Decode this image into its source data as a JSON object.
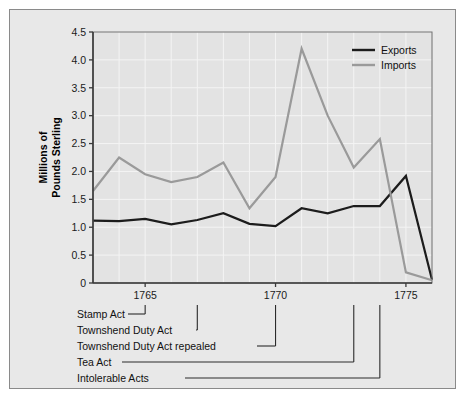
{
  "figure": {
    "background_color": "#e8e8e8",
    "border_color": "#8a8a8a",
    "plot_background": "#e3e3e3",
    "grid_color": "#f4f4f4",
    "axis_color": "#3a3a3a"
  },
  "chart_data": {
    "type": "line",
    "title": "",
    "xlabel": "",
    "ylabel": "Millions of\nPounds Sterling",
    "ylabel_line1": "Millions of",
    "ylabel_line2": "Pounds Sterling",
    "xlim": [
      1763,
      1776
    ],
    "ylim": [
      0,
      4.5
    ],
    "grid": true,
    "legend_position": "top-right",
    "y_ticks": [
      0,
      0.5,
      1.0,
      1.5,
      2.0,
      2.5,
      3.0,
      3.5,
      4.0,
      4.5
    ],
    "y_tick_labels": [
      "0",
      "0.5",
      "1.0",
      "1.5",
      "2.0",
      "2.5",
      "3.0",
      "3.5",
      "4.0",
      "4.5"
    ],
    "x_ticks": [
      1765,
      1770,
      1775
    ],
    "x_tick_labels": [
      "1765",
      "1770",
      "1775"
    ],
    "x": [
      1763,
      1764,
      1765,
      1766,
      1767,
      1768,
      1769,
      1770,
      1771,
      1772,
      1773,
      1774,
      1775,
      1776
    ],
    "series": [
      {
        "name": "Exports",
        "color": "#1c1c1c",
        "width": 2.2,
        "values": [
          1.12,
          1.11,
          1.15,
          1.05,
          1.13,
          1.25,
          1.06,
          1.02,
          1.34,
          1.25,
          1.38,
          1.38,
          1.92,
          0.06
        ]
      },
      {
        "name": "Imports",
        "color": "#9a9a9a",
        "width": 2.2,
        "values": [
          1.65,
          2.25,
          1.95,
          1.81,
          1.9,
          2.16,
          1.34,
          1.9,
          4.2,
          3.0,
          2.07,
          2.58,
          0.19,
          0.05
        ]
      }
    ]
  },
  "legend": {
    "items": [
      {
        "label": "Exports",
        "color": "#1c1c1c"
      },
      {
        "label": "Imports",
        "color": "#9a9a9a"
      }
    ]
  },
  "annotations": [
    {
      "label": "Stamp Act",
      "year": 1765
    },
    {
      "label": "Townshend Duty Act",
      "year": 1767
    },
    {
      "label": "Townshend Duty Act repealed",
      "year": 1770
    },
    {
      "label": "Tea Act",
      "year": 1773
    },
    {
      "label": "Intolerable Acts",
      "year": 1774
    }
  ]
}
